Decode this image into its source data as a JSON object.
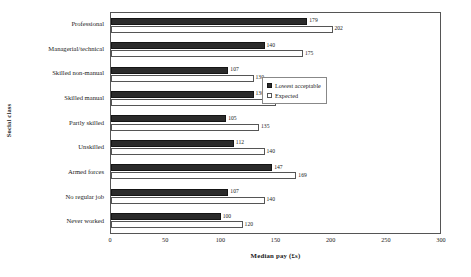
{
  "chart_data": {
    "type": "bar",
    "orientation": "horizontal",
    "title": "",
    "xlabel": "Median pay (£s)",
    "ylabel": "Social class",
    "xlim": [
      0,
      300
    ],
    "xticks": [
      0,
      50,
      100,
      150,
      200,
      250,
      300
    ],
    "grid": false,
    "legend_position": "center-right",
    "categories": [
      "Professional",
      "Managerial/technical",
      "Skilled non-manual",
      "Skilled manual",
      "Partly skilled",
      "Unskilled",
      "Armed forces",
      "No regular job",
      "Never worked"
    ],
    "series": [
      {
        "name": "Lowest acceptable",
        "style": "filled",
        "color": "#2b2b2b",
        "values": [
          179,
          140,
          107,
          130,
          105,
          112,
          147,
          107,
          100
        ]
      },
      {
        "name": "Expected",
        "style": "open",
        "color": "#ffffff",
        "values": [
          202,
          175,
          130,
          150,
          135,
          140,
          169,
          140,
          120
        ]
      }
    ]
  }
}
